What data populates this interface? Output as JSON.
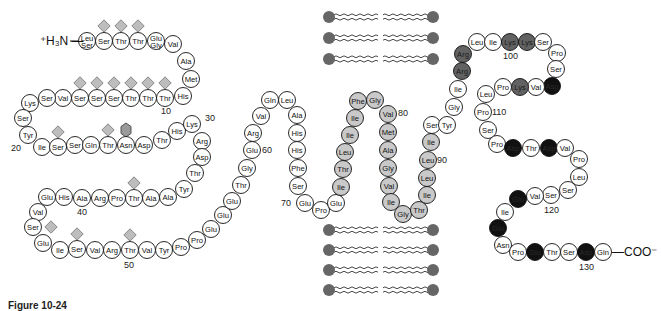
{
  "figure": {
    "caption": "Figure 10-24",
    "n_terminus": "⁺H₃N —",
    "c_terminus": "—COO⁻",
    "colors": {
      "extracellular": "#ffffff",
      "transmembrane": "#c9c9c9",
      "basic": "#626262",
      "acidic": "#111111",
      "glycan_o": "#bdbdbd",
      "glycan_n": "#9a9a9a",
      "lipid_head": "#666666"
    }
  },
  "residues": [
    {
      "n": 1,
      "aa": "Leu/Ser",
      "type": "plain"
    },
    {
      "n": 2,
      "aa": "Ser",
      "type": "plain"
    },
    {
      "n": 3,
      "aa": "Thr",
      "type": "plain"
    },
    {
      "n": 4,
      "aa": "Thr",
      "type": "plain"
    },
    {
      "n": 5,
      "aa": "Glu/Gly",
      "type": "plain"
    },
    {
      "n": 6,
      "aa": "Val",
      "type": "plain"
    },
    {
      "n": 7,
      "aa": "Ala",
      "type": "plain"
    },
    {
      "n": 8,
      "aa": "Met",
      "type": "plain"
    },
    {
      "n": 9,
      "aa": "His",
      "type": "plain"
    },
    {
      "n": 10,
      "aa": "Thr",
      "type": "plain"
    },
    {
      "n": 11,
      "aa": "Thr",
      "type": "plain"
    },
    {
      "n": 12,
      "aa": "Thr",
      "type": "plain"
    },
    {
      "n": 13,
      "aa": "Ser",
      "type": "plain"
    },
    {
      "n": 14,
      "aa": "Ser",
      "type": "plain"
    },
    {
      "n": 15,
      "aa": "Ser",
      "type": "plain"
    },
    {
      "n": 16,
      "aa": "Val",
      "type": "plain"
    },
    {
      "n": 17,
      "aa": "Ser",
      "type": "plain"
    },
    {
      "n": 18,
      "aa": "Lys",
      "type": "plain"
    },
    {
      "n": 19,
      "aa": "Ser",
      "type": "plain"
    },
    {
      "n": 20,
      "aa": "Tyr",
      "type": "plain"
    },
    {
      "n": 21,
      "aa": "Ile",
      "type": "plain"
    },
    {
      "n": 22,
      "aa": "Ser",
      "type": "plain"
    },
    {
      "n": 23,
      "aa": "Ser",
      "type": "plain"
    },
    {
      "n": 24,
      "aa": "Gln",
      "type": "plain"
    },
    {
      "n": 25,
      "aa": "Thr",
      "type": "plain"
    },
    {
      "n": 26,
      "aa": "Asn",
      "type": "plain"
    },
    {
      "n": 27,
      "aa": "Asp",
      "type": "plain"
    },
    {
      "n": 28,
      "aa": "Thr",
      "type": "plain"
    },
    {
      "n": 29,
      "aa": "His",
      "type": "plain"
    },
    {
      "n": 30,
      "aa": "Lys",
      "type": "plain"
    },
    {
      "n": 31,
      "aa": "Arg",
      "type": "plain"
    },
    {
      "n": 32,
      "aa": "Asp",
      "type": "plain"
    },
    {
      "n": 33,
      "aa": "Thr",
      "type": "plain"
    },
    {
      "n": 34,
      "aa": "Tyr",
      "type": "plain"
    },
    {
      "n": 35,
      "aa": "Ala",
      "type": "plain"
    },
    {
      "n": 36,
      "aa": "Ala",
      "type": "plain"
    },
    {
      "n": 37,
      "aa": "Thr",
      "type": "plain"
    },
    {
      "n": 38,
      "aa": "Pro",
      "type": "plain"
    },
    {
      "n": 39,
      "aa": "Arg",
      "type": "plain"
    },
    {
      "n": 40,
      "aa": "Ala",
      "type": "plain"
    },
    {
      "n": 41,
      "aa": "His",
      "type": "plain"
    },
    {
      "n": 42,
      "aa": "Glu",
      "type": "plain"
    },
    {
      "n": 43,
      "aa": "Val",
      "type": "plain"
    },
    {
      "n": 44,
      "aa": "Ser",
      "type": "plain"
    },
    {
      "n": 45,
      "aa": "Glu",
      "type": "plain"
    },
    {
      "n": 46,
      "aa": "Ile",
      "type": "plain"
    },
    {
      "n": 47,
      "aa": "Ser",
      "type": "plain"
    },
    {
      "n": 48,
      "aa": "Val",
      "type": "plain"
    },
    {
      "n": 49,
      "aa": "Arg",
      "type": "plain"
    },
    {
      "n": 50,
      "aa": "Thr",
      "type": "plain"
    },
    {
      "n": 51,
      "aa": "Val",
      "type": "plain"
    },
    {
      "n": 52,
      "aa": "Tyr",
      "type": "plain"
    },
    {
      "n": 53,
      "aa": "Pro",
      "type": "plain"
    },
    {
      "n": 54,
      "aa": "Pro",
      "type": "plain"
    },
    {
      "n": 55,
      "aa": "Glu",
      "type": "plain"
    },
    {
      "n": 56,
      "aa": "Glu",
      "type": "plain"
    },
    {
      "n": 57,
      "aa": "Glu",
      "type": "plain"
    },
    {
      "n": 58,
      "aa": "Thr",
      "type": "plain"
    },
    {
      "n": 59,
      "aa": "Gly",
      "type": "plain"
    },
    {
      "n": 60,
      "aa": "Glu",
      "type": "plain"
    },
    {
      "n": 61,
      "aa": "Arg",
      "type": "plain"
    },
    {
      "n": 62,
      "aa": "Val",
      "type": "plain"
    },
    {
      "n": 63,
      "aa": "Gln",
      "type": "plain"
    },
    {
      "n": 64,
      "aa": "Leu",
      "type": "plain"
    },
    {
      "n": 65,
      "aa": "Ala",
      "type": "plain"
    },
    {
      "n": 66,
      "aa": "His",
      "type": "plain"
    },
    {
      "n": 67,
      "aa": "His",
      "type": "plain"
    },
    {
      "n": 68,
      "aa": "Phe",
      "type": "plain"
    },
    {
      "n": 69,
      "aa": "Ser",
      "type": "plain"
    },
    {
      "n": 70,
      "aa": "Glu",
      "type": "plain"
    },
    {
      "n": 71,
      "aa": "Pro",
      "type": "plain"
    },
    {
      "n": 72,
      "aa": "Glu",
      "type": "plain"
    },
    {
      "n": 73,
      "aa": "Ile",
      "type": "tm"
    },
    {
      "n": 74,
      "aa": "Thr",
      "type": "tm"
    },
    {
      "n": 75,
      "aa": "Leu",
      "type": "tm"
    },
    {
      "n": 76,
      "aa": "Ile",
      "type": "tm"
    },
    {
      "n": 77,
      "aa": "Ile",
      "type": "tm"
    },
    {
      "n": 78,
      "aa": "Phe",
      "type": "tm"
    },
    {
      "n": 79,
      "aa": "Gly",
      "type": "tm"
    },
    {
      "n": 80,
      "aa": "Val",
      "type": "tm"
    },
    {
      "n": 81,
      "aa": "Met",
      "type": "tm"
    },
    {
      "n": 82,
      "aa": "Ala",
      "type": "tm"
    },
    {
      "n": 83,
      "aa": "Gly",
      "type": "tm"
    },
    {
      "n": 84,
      "aa": "Val",
      "type": "tm"
    },
    {
      "n": 85,
      "aa": "Ile",
      "type": "tm"
    },
    {
      "n": 86,
      "aa": "Gly",
      "type": "tm"
    },
    {
      "n": 87,
      "aa": "Thr",
      "type": "tm"
    },
    {
      "n": 88,
      "aa": "Ile",
      "type": "tm"
    },
    {
      "n": 89,
      "aa": "Leu",
      "type": "tm"
    },
    {
      "n": 90,
      "aa": "Leu",
      "type": "tm"
    },
    {
      "n": 91,
      "aa": "Ile",
      "type": "tm"
    },
    {
      "n": 92,
      "aa": "Ser",
      "type": "plain"
    },
    {
      "n": 93,
      "aa": "Tyr",
      "type": "plain"
    },
    {
      "n": 94,
      "aa": "Gly",
      "type": "plain"
    },
    {
      "n": 95,
      "aa": "Ile",
      "type": "plain"
    },
    {
      "n": 96,
      "aa": "Arg",
      "type": "basic"
    },
    {
      "n": 97,
      "aa": "Arg",
      "type": "basic"
    },
    {
      "n": 98,
      "aa": "Leu",
      "type": "plain"
    },
    {
      "n": 99,
      "aa": "Ile",
      "type": "plain"
    },
    {
      "n": 100,
      "aa": "Lys",
      "type": "basic"
    },
    {
      "n": 101,
      "aa": "Lys",
      "type": "basic"
    },
    {
      "n": 102,
      "aa": "Ser",
      "type": "plain"
    },
    {
      "n": 103,
      "aa": "Pro",
      "type": "plain"
    },
    {
      "n": 104,
      "aa": "Ser",
      "type": "plain"
    },
    {
      "n": 105,
      "aa": "Asp",
      "type": "acidic"
    },
    {
      "n": 106,
      "aa": "Val",
      "type": "plain"
    },
    {
      "n": 107,
      "aa": "Lys",
      "type": "basic"
    },
    {
      "n": 108,
      "aa": "Pro",
      "type": "plain"
    },
    {
      "n": 109,
      "aa": "Leu",
      "type": "plain"
    },
    {
      "n": 110,
      "aa": "Pro",
      "type": "plain"
    },
    {
      "n": 111,
      "aa": "Ser",
      "type": "plain"
    },
    {
      "n": 112,
      "aa": "Pro",
      "type": "plain"
    },
    {
      "n": 113,
      "aa": "Asp",
      "type": "acidic"
    },
    {
      "n": 114,
      "aa": "Thr",
      "type": "plain"
    },
    {
      "n": 115,
      "aa": "Asp",
      "type": "acidic"
    },
    {
      "n": 116,
      "aa": "Val",
      "type": "plain"
    },
    {
      "n": 117,
      "aa": "Pro",
      "type": "plain"
    },
    {
      "n": 118,
      "aa": "Leu",
      "type": "plain"
    },
    {
      "n": 119,
      "aa": "Ser",
      "type": "plain"
    },
    {
      "n": 120,
      "aa": "Ser",
      "type": "plain"
    },
    {
      "n": 121,
      "aa": "Val",
      "type": "plain"
    },
    {
      "n": 122,
      "aa": "Glu",
      "type": "acidic"
    },
    {
      "n": 123,
      "aa": "Ile",
      "type": "plain"
    },
    {
      "n": 124,
      "aa": "Glu",
      "type": "acidic"
    },
    {
      "n": 125,
      "aa": "Asn",
      "type": "plain"
    },
    {
      "n": 126,
      "aa": "Pro",
      "type": "plain"
    },
    {
      "n": 127,
      "aa": "Glu",
      "type": "acidic"
    },
    {
      "n": 128,
      "aa": "Thr",
      "type": "plain"
    },
    {
      "n": 129,
      "aa": "Ser",
      "type": "plain"
    },
    {
      "n": 130,
      "aa": "Asp",
      "type": "acidic"
    },
    {
      "n": 131,
      "aa": "Gln",
      "type": "plain"
    }
  ],
  "position_labels": [
    "10",
    "20",
    "30",
    "40",
    "50",
    "60",
    "70",
    "80",
    "90",
    "100",
    "110",
    "120",
    "130"
  ],
  "glycosylation": [
    {
      "residue": 2,
      "kind": "O-linked"
    },
    {
      "residue": 3,
      "kind": "O-linked"
    },
    {
      "residue": 4,
      "kind": "O-linked"
    },
    {
      "residue": 10,
      "kind": "O-linked"
    },
    {
      "residue": 11,
      "kind": "O-linked"
    },
    {
      "residue": 12,
      "kind": "O-linked"
    },
    {
      "residue": 13,
      "kind": "O-linked"
    },
    {
      "residue": 14,
      "kind": "O-linked"
    },
    {
      "residue": 15,
      "kind": "O-linked"
    },
    {
      "residue": 22,
      "kind": "O-linked"
    },
    {
      "residue": 25,
      "kind": "O-linked"
    },
    {
      "residue": 26,
      "kind": "N-linked"
    },
    {
      "residue": 37,
      "kind": "O-linked"
    },
    {
      "residue": 44,
      "kind": "O-linked"
    },
    {
      "residue": 47,
      "kind": "O-linked"
    },
    {
      "residue": 50,
      "kind": "O-linked"
    }
  ],
  "membrane": {
    "outer_leaflet_lipids": 3,
    "inner_leaflet_lipids": 4
  }
}
